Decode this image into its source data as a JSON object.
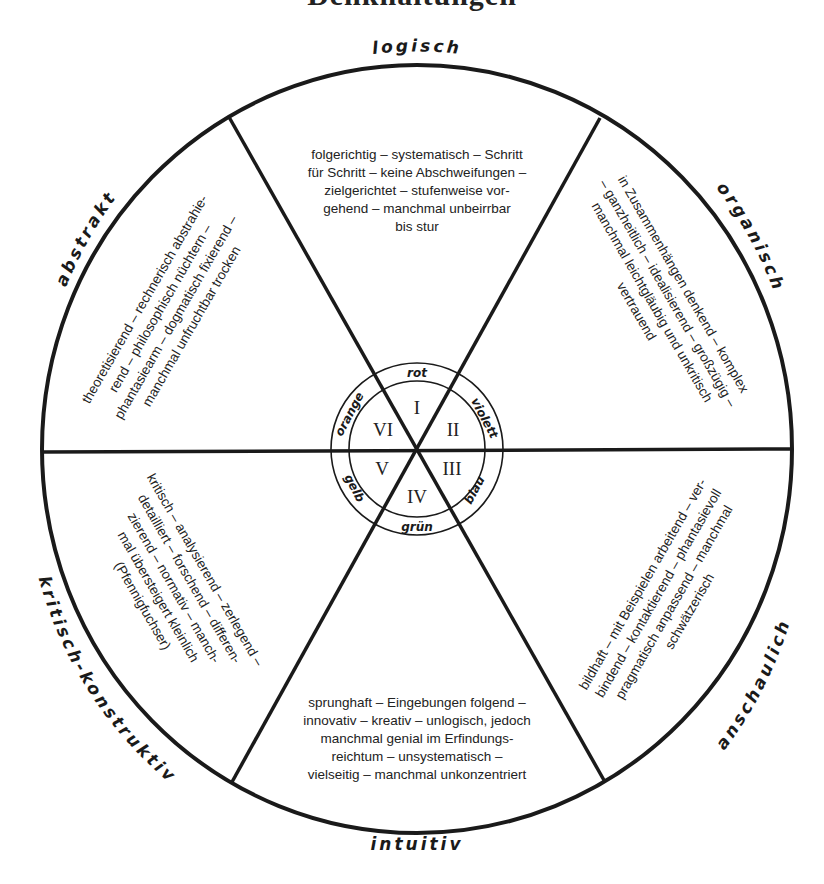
{
  "title": "Denkhaltungen",
  "diagram": {
    "outer_labels": {
      "top": "logisch",
      "upper_right": "organisch",
      "lower_right": "anschaulich",
      "bottom": "intuitiv",
      "lower_left": "kritisch-konstruktiv",
      "upper_left": "abstrakt"
    },
    "sectors": [
      {
        "numeral": "I",
        "color": "rot",
        "style": "logisch",
        "lines": [
          "folgerichtig – systematisch – Schritt",
          "für Schritt – keine Abschweifungen –",
          "zielgerichtet – stufenweise vor-",
          "gehend – manchmal unbeirrbar",
          "bis stur"
        ]
      },
      {
        "numeral": "II",
        "color": "violett",
        "style": "organisch",
        "lines": [
          "in Zusammenhängen denkend – komplex",
          "– ganzheitlich – idealisierend – großzügig –",
          "manchmal leichtgläubig und unkritisch",
          "vertrauend"
        ]
      },
      {
        "numeral": "III",
        "color": "blau",
        "style": "anschaulich",
        "lines": [
          "bildhaft – mit Beispielen arbeitend – ver-",
          "bindend – kontaktierend – phantasievoll",
          "pragmatisch anpassend – manchmal",
          "schwätzerisch"
        ]
      },
      {
        "numeral": "IV",
        "color": "grün",
        "style": "intuitiv",
        "lines": [
          "sprunghaft – Eingebungen folgend –",
          "innovativ – kreativ – unlogisch, jedoch",
          "manchmal genial im Erfindungs-",
          "reichtum – unsystematisch –",
          "vielseitig – manchmal unkonzentriert"
        ]
      },
      {
        "numeral": "V",
        "color": "gelb",
        "style": "kritisch-konstruktiv",
        "lines": [
          "kritisch – analysierend – zerlegend –",
          "detailliert – forschend – differen-",
          "zierend – normativ – manch-",
          "mal übersteigert kleinlich",
          "(Pfennigfuchser)"
        ]
      },
      {
        "numeral": "VI",
        "color": "orange",
        "style": "abstrakt",
        "lines": [
          "theoretisierend – rechnerisch abstrahie-",
          "rend – philosophisch nüchtern –",
          "phantasiearm – dogmatisch fixierend –",
          "manchmal unfruchtbar trocken"
        ]
      }
    ]
  }
}
